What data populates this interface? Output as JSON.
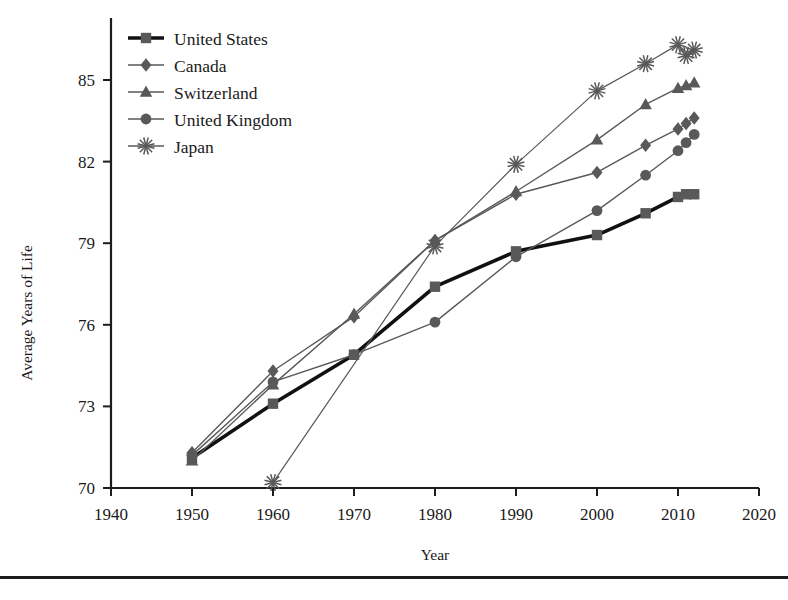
{
  "chart_data": {
    "type": "line",
    "title": "",
    "xlabel": "Year",
    "ylabel": "Average Years of Life",
    "xlim": [
      1940,
      2020
    ],
    "ylim": [
      70,
      86.5
    ],
    "xticks": [
      1940,
      1950,
      1960,
      1970,
      1980,
      1990,
      2000,
      2010,
      2020
    ],
    "yticks": [
      70,
      73,
      76,
      79,
      82,
      85
    ],
    "grid": false,
    "legend_position": "top-left",
    "series": [
      {
        "name": "United States",
        "marker": "square",
        "color": "#595959",
        "line_weight": "heavy",
        "points": [
          {
            "x": 1950,
            "y": 71.1
          },
          {
            "x": 1960,
            "y": 73.1
          },
          {
            "x": 1970,
            "y": 74.9
          },
          {
            "x": 1980,
            "y": 77.4
          },
          {
            "x": 1990,
            "y": 78.7
          },
          {
            "x": 2000,
            "y": 79.3
          },
          {
            "x": 2006,
            "y": 80.1
          },
          {
            "x": 2010,
            "y": 80.7
          },
          {
            "x": 2011,
            "y": 80.8
          },
          {
            "x": 2012,
            "y": 80.8
          }
        ]
      },
      {
        "name": "Canada",
        "marker": "diamond",
        "color": "#595959",
        "line_weight": "normal",
        "points": [
          {
            "x": 1950,
            "y": 71.3
          },
          {
            "x": 1960,
            "y": 74.3
          },
          {
            "x": 1970,
            "y": 76.3
          },
          {
            "x": 1980,
            "y": 79.1
          },
          {
            "x": 1990,
            "y": 80.8
          },
          {
            "x": 2000,
            "y": 81.6
          },
          {
            "x": 2006,
            "y": 82.6
          },
          {
            "x": 2010,
            "y": 83.2
          },
          {
            "x": 2011,
            "y": 83.4
          },
          {
            "x": 2012,
            "y": 83.6
          }
        ]
      },
      {
        "name": "Switzerland",
        "marker": "triangle",
        "color": "#595959",
        "line_weight": "normal",
        "points": [
          {
            "x": 1950,
            "y": 71.0
          },
          {
            "x": 1960,
            "y": 73.8
          },
          {
            "x": 1970,
            "y": 76.4
          },
          {
            "x": 1980,
            "y": 79.1
          },
          {
            "x": 1990,
            "y": 80.9
          },
          {
            "x": 2000,
            "y": 82.8
          },
          {
            "x": 2006,
            "y": 84.1
          },
          {
            "x": 2010,
            "y": 84.7
          },
          {
            "x": 2011,
            "y": 84.8
          },
          {
            "x": 2012,
            "y": 84.9
          }
        ]
      },
      {
        "name": "United Kingdom",
        "marker": "circle",
        "color": "#595959",
        "line_weight": "normal",
        "points": [
          {
            "x": 1950,
            "y": 71.2
          },
          {
            "x": 1960,
            "y": 73.9
          },
          {
            "x": 1970,
            "y": 74.9
          },
          {
            "x": 1980,
            "y": 76.1
          },
          {
            "x": 1990,
            "y": 78.5
          },
          {
            "x": 2000,
            "y": 80.2
          },
          {
            "x": 2006,
            "y": 81.5
          },
          {
            "x": 2010,
            "y": 82.4
          },
          {
            "x": 2011,
            "y": 82.7
          },
          {
            "x": 2012,
            "y": 83.0
          }
        ]
      },
      {
        "name": "Japan",
        "marker": "asterisk",
        "color": "#595959",
        "line_weight": "thin",
        "points": [
          {
            "x": 1960,
            "y": 70.2
          },
          {
            "x": 1980,
            "y": 78.9
          },
          {
            "x": 1990,
            "y": 81.9
          },
          {
            "x": 2000,
            "y": 84.6
          },
          {
            "x": 2006,
            "y": 85.6
          },
          {
            "x": 2010,
            "y": 86.3
          },
          {
            "x": 2011,
            "y": 85.9
          },
          {
            "x": 2012,
            "y": 86.1
          }
        ]
      }
    ]
  },
  "legend": {
    "items": [
      {
        "label": "United States",
        "marker": "square"
      },
      {
        "label": "Canada",
        "marker": "diamond"
      },
      {
        "label": "Switzerland",
        "marker": "triangle"
      },
      {
        "label": "United Kingdom",
        "marker": "circle"
      },
      {
        "label": "Japan",
        "marker": "asterisk"
      }
    ]
  },
  "axes": {
    "x_title": "Year",
    "y_title": "Average Years of Life",
    "x_tick_labels": [
      "1940",
      "1950",
      "1960",
      "1970",
      "1980",
      "1990",
      "2000",
      "2010",
      "2020"
    ],
    "y_tick_labels": [
      "70",
      "73",
      "76",
      "79",
      "82",
      "85"
    ]
  },
  "colors": {
    "line": "#595959",
    "heavy_line": "#111111",
    "axis": "#1d1d1d",
    "text": "#1a1a1a",
    "background": "#ffffff"
  }
}
